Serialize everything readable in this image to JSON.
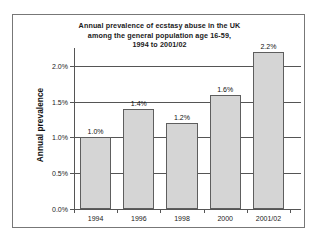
{
  "chart_data": {
    "type": "bar",
    "title": "Annual prevalence of ecstasy abuse in the UK among the general population age 16-59, 1994 to 2001/02",
    "title_lines": [
      "Annual prevalence of ecstasy abuse in the UK",
      "among the general population age 16-59,",
      "1994 to 2001/02"
    ],
    "xlabel": "",
    "ylabel": "Annual prevalence",
    "categories": [
      "1994",
      "1996",
      "1998",
      "2000",
      "2001/02"
    ],
    "values": [
      1.0,
      1.4,
      1.2,
      1.6,
      2.2
    ],
    "data_labels": [
      "1.0%",
      "1.4%",
      "1.2%",
      "1.6%",
      "2.2%"
    ],
    "ylim": [
      0.0,
      2.25
    ],
    "yticks": [
      0.0,
      0.5,
      1.0,
      1.5,
      2.0
    ],
    "ytick_labels": [
      "0.0%",
      "0.5%",
      "1.0%",
      "1.5%",
      "2.0%"
    ],
    "grid": true,
    "legend": null,
    "bar_fill_color": "#d5d5d5",
    "bar_edge_color": "#5e5e5e",
    "axis_color": "#555555",
    "text_color": "#111111",
    "background_color": "#ffffff"
  }
}
